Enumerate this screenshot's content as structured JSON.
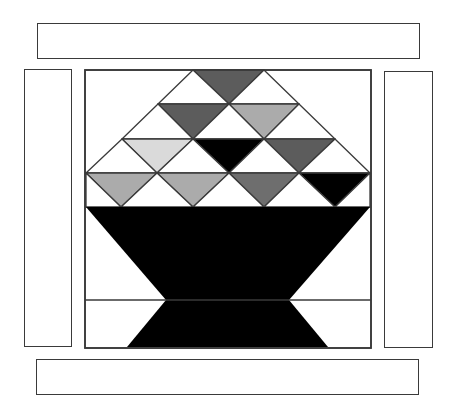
{
  "figure": {
    "colors": {
      "outline": "#3a3a3a",
      "background": "#ffffff",
      "black": "#000000",
      "dark_gray": "#5c5c5c",
      "mid_gray": "#6e6e6e",
      "light_gray": "#ababab",
      "very_light_gray": "#dadada"
    },
    "borders": {
      "top": {
        "x": 37,
        "y": 23,
        "w": 383,
        "h": 36
      },
      "bottom": {
        "x": 36,
        "y": 359,
        "w": 383,
        "h": 36
      },
      "left": {
        "x": 24,
        "y": 69,
        "w": 48,
        "h": 278
      },
      "right": {
        "x": 384,
        "y": 71,
        "w": 49,
        "h": 277
      }
    },
    "block": {
      "x": 85,
      "y": 70,
      "w": 286,
      "h": 278
    },
    "grid": {
      "row_lines_y": [
        104,
        139,
        173,
        207,
        300
      ],
      "horizontal_line_y": 300
    },
    "triangles": [
      {
        "row": 1,
        "points": "193,70 264,70 229,104",
        "fill": "dark_gray"
      },
      {
        "row": 1,
        "points": "193,70 158,104 229,104",
        "fill": "none"
      },
      {
        "row": 1,
        "points": "264,70 229,104 299,104",
        "fill": "none"
      },
      {
        "row": 2,
        "points": "158,104 229,104 193,139",
        "fill": "dark_gray"
      },
      {
        "row": 2,
        "points": "229,104 299,104 264,139",
        "fill": "light_gray"
      },
      {
        "row": 2,
        "points": "158,104 122,139 193,139",
        "fill": "none"
      },
      {
        "row": 2,
        "points": "229,104 193,139 264,139",
        "fill": "none"
      },
      {
        "row": 2,
        "points": "299,104 264,139 335,139",
        "fill": "none"
      },
      {
        "row": 3,
        "points": "122,139 193,139 157,173",
        "fill": "very_light_gray"
      },
      {
        "row": 3,
        "points": "193,139 264,139 229,173",
        "fill": "black"
      },
      {
        "row": 3,
        "points": "264,139 335,139 299,173",
        "fill": "dark_gray"
      },
      {
        "row": 3,
        "points": "122,139 86,173 157,173",
        "fill": "none"
      },
      {
        "row": 3,
        "points": "193,139 157,173 229,173",
        "fill": "none"
      },
      {
        "row": 3,
        "points": "264,139 229,173 299,173",
        "fill": "none"
      },
      {
        "row": 3,
        "points": "335,139 299,173 370,173",
        "fill": "none"
      },
      {
        "row": 4,
        "points": "86,173 157,173 121,207",
        "fill": "light_gray"
      },
      {
        "row": 4,
        "points": "157,173 229,173 193,207",
        "fill": "light_gray"
      },
      {
        "row": 4,
        "points": "229,173 299,173 264,207",
        "fill": "mid_gray"
      },
      {
        "row": 4,
        "points": "299,173 370,173 335,207",
        "fill": "black"
      },
      {
        "row": 4,
        "points": "86,173 86,207 121,207",
        "fill": "none"
      },
      {
        "row": 4,
        "points": "157,173 121,207 193,207",
        "fill": "none"
      },
      {
        "row": 4,
        "points": "229,173 193,207 264,207",
        "fill": "none"
      },
      {
        "row": 4,
        "points": "299,173 264,207 335,207",
        "fill": "none"
      },
      {
        "row": 4,
        "points": "370,173 335,207 370,207",
        "fill": "none"
      }
    ],
    "basket": {
      "upper_trapezoid": "86,207 370,207 289,300 166,300",
      "lower_trapezoid": "166,300 289,300 328,347 127,347",
      "fill": "black"
    }
  }
}
